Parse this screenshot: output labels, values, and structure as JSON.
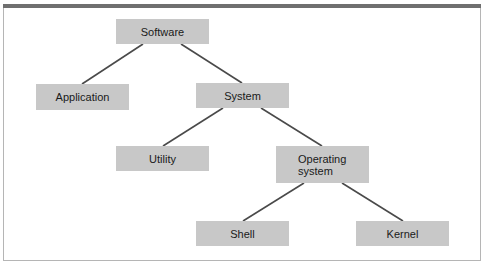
{
  "diagram": {
    "type": "tree",
    "nodes": {
      "software": {
        "label": "Software"
      },
      "application": {
        "label": "Application"
      },
      "system": {
        "label": "System"
      },
      "utility": {
        "label": "Utility"
      },
      "operating_system": {
        "line1": "Operating",
        "line2": "system"
      },
      "shell": {
        "label": "Shell"
      },
      "kernel": {
        "label": "Kernel"
      }
    },
    "edges": [
      [
        "Software",
        "Application"
      ],
      [
        "Software",
        "System"
      ],
      [
        "System",
        "Utility"
      ],
      [
        "System",
        "Operating system"
      ],
      [
        "Operating system",
        "Shell"
      ],
      [
        "Operating system",
        "Kernel"
      ]
    ],
    "colors": {
      "node_fill": "#c8c8c8",
      "edge": "#4a4a4a",
      "top_bar": "#6f6f6f",
      "frame_border": "#b5b5b5"
    }
  }
}
